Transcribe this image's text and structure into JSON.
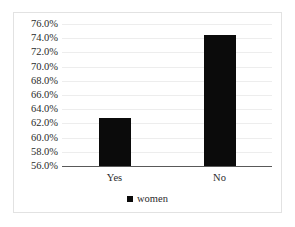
{
  "chart_data": {
    "type": "bar",
    "title": "",
    "xlabel": "",
    "ylabel": "",
    "categories": [
      "Yes",
      "No"
    ],
    "series": [
      {
        "name": "women",
        "values": [
          62.8,
          74.4
        ],
        "color": "#0b0b0b"
      }
    ],
    "ylim": [
      56.0,
      76.0
    ],
    "ytick_values": [
      76.0,
      74.0,
      72.0,
      70.0,
      68.0,
      66.0,
      64.0,
      62.0,
      60.0,
      58.0,
      56.0
    ],
    "ytick_labels": [
      "76.0%",
      "74.0%",
      "72.0%",
      "70.0%",
      "68.0%",
      "66.0%",
      "64.0%",
      "62.0%",
      "60.0%",
      "58.0%",
      "56.0%"
    ],
    "grid": true,
    "grid_color": "#ededed",
    "axis_color": "#595959",
    "legend": {
      "position": "bottom",
      "entries": [
        {
          "label": "women",
          "color": "#0b0b0b",
          "marker": "square"
        }
      ]
    },
    "frame": {
      "border_color": "#e2e2e2",
      "background": "#ffffff"
    }
  }
}
